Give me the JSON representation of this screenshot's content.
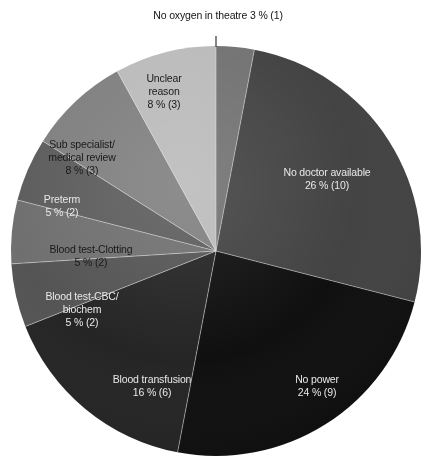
{
  "chart_data": {
    "type": "pie",
    "title": "",
    "subtitle": "",
    "xlabel": "",
    "ylabel": "",
    "legend_position": "none",
    "grid": false,
    "value_format": "{percent} % ({count})",
    "total_count": 38,
    "categories": [
      "No oxygen in theatre",
      "No doctor available",
      "No power",
      "Blood transfusion",
      "Blood test-CBC/ biochem",
      "Blood test-Clotting",
      "Preterm",
      "Sub specialist/ medical review",
      "Unclear reason"
    ],
    "values": [
      3,
      26,
      24,
      16,
      5,
      5,
      5,
      8,
      8
    ],
    "counts": [
      1,
      10,
      9,
      6,
      2,
      2,
      2,
      3,
      3
    ],
    "colors": [
      "#6e6e6e",
      "#3d3d3d",
      "#080808",
      "#1e1e1e",
      "#4f4f4f",
      "#6b6b6b",
      "#585858",
      "#7c7c7c",
      "#b9b9b9"
    ],
    "slices": [
      {
        "id": "no-oxygen-in-theatre",
        "name_line1": "No oxygen in theatre",
        "name_line2": "",
        "percent_text": "3 % (1)",
        "percent": 3,
        "count": 1,
        "color": "#6e6e6e",
        "label_placement": "callout",
        "label_color": "dark"
      },
      {
        "id": "no-doctor-available",
        "name_line1": "No doctor available",
        "name_line2": "",
        "percent_text": "26 % (10)",
        "percent": 26,
        "count": 10,
        "color": "#3d3d3d",
        "label_placement": "inside",
        "label_color": "light"
      },
      {
        "id": "no-power",
        "name_line1": "No power",
        "name_line2": "",
        "percent_text": "24 % (9)",
        "percent": 24,
        "count": 9,
        "color": "#080808",
        "label_placement": "inside",
        "label_color": "light"
      },
      {
        "id": "blood-transfusion",
        "name_line1": "Blood transfusion",
        "name_line2": "",
        "percent_text": "16 % (6)",
        "percent": 16,
        "count": 6,
        "color": "#1e1e1e",
        "label_placement": "inside",
        "label_color": "light"
      },
      {
        "id": "blood-test-cbc-biochem",
        "name_line1": "Blood test-CBC/",
        "name_line2": "biochem",
        "percent_text": "5 % (2)",
        "percent": 5,
        "count": 2,
        "color": "#4f4f4f",
        "label_placement": "inside",
        "label_color": "light"
      },
      {
        "id": "blood-test-clotting",
        "name_line1": "Blood test-Clotting",
        "name_line2": "",
        "percent_text": "5 % (2)",
        "percent": 5,
        "count": 2,
        "color": "#6b6b6b",
        "label_placement": "inside",
        "label_color": "dark"
      },
      {
        "id": "preterm",
        "name_line1": "Preterm",
        "name_line2": "",
        "percent_text": "5 % (2)",
        "percent": 5,
        "count": 2,
        "color": "#585858",
        "label_placement": "inside",
        "label_color": "light"
      },
      {
        "id": "sub-specialist-medical-review",
        "name_line1": "Sub specialist/",
        "name_line2": "medical review",
        "percent_text": "8 % (3)",
        "percent": 8,
        "count": 3,
        "color": "#7c7c7c",
        "label_placement": "inside",
        "label_color": "dark"
      },
      {
        "id": "unclear-reason",
        "name_line1": "Unclear",
        "name_line2": "reason",
        "percent_text": "8 % (3)",
        "percent": 8,
        "count": 3,
        "color": "#b9b9b9",
        "label_placement": "inside",
        "label_color": "dark"
      }
    ]
  },
  "geometry": {
    "center_x": 216,
    "center_y": 251,
    "radius": 205
  }
}
